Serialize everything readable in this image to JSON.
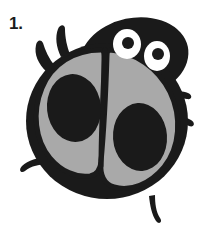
{
  "page": {
    "background_color": "#ffffff",
    "width": 218,
    "height": 234
  },
  "label": {
    "step_number": "1.",
    "color": "#1a1a1a"
  },
  "illustration": {
    "subject": "ladybug",
    "style": "cartoon line drawing",
    "colors": {
      "body_black": "#1a1a1a",
      "wing_gray": "#a9a9a9",
      "eye_white": "#ffffff",
      "outline": "#1a1a1a"
    },
    "parts": {
      "body_label": "ladybug-body",
      "head_label": "ladybug-head",
      "left_wing_label": "left-wing",
      "right_wing_label": "right-wing",
      "left_spot_label": "left-wing-spot",
      "right_spot_label": "right-wing-spot",
      "wing_divider_label": "wing-divider-line",
      "left_eye_label": "left-eye",
      "right_eye_label": "right-eye",
      "left_pupil_label": "left-pupil",
      "right_pupil_label": "right-pupil"
    },
    "counts": {
      "eyes": 2,
      "spots": 2,
      "legs": 6
    }
  }
}
